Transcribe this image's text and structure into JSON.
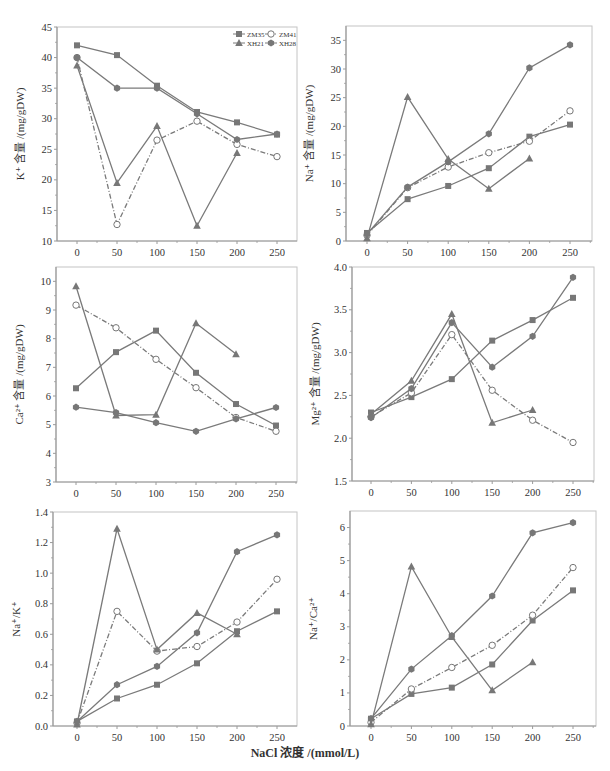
{
  "figure": {
    "shared_xlabel": "NaCl 浓度 /(mmol/L)",
    "legend": [
      {
        "name": "ZM35",
        "marker": "square",
        "dash": "solid"
      },
      {
        "name": "ZM41",
        "marker": "open-circle",
        "dash": "dashdot"
      },
      {
        "name": "XH21",
        "marker": "triangle",
        "dash": "solid"
      },
      {
        "name": "XH28",
        "marker": "hexagon",
        "dash": "solid"
      }
    ],
    "colors": {
      "line": "#7a7a7a",
      "marker": "#777777",
      "axis": "#9a9a9a",
      "text": "#333333"
    }
  },
  "chart_data": [
    {
      "type": "line",
      "title": "",
      "ylabel": "K⁺ 含量 /(mg/gDW)",
      "xlabel": "",
      "x": [
        0,
        50,
        100,
        150,
        200,
        250
      ],
      "xticks": [
        0,
        50,
        100,
        150,
        200,
        250
      ],
      "ylim": [
        10,
        45
      ],
      "yticks": [
        10,
        15,
        20,
        25,
        30,
        35,
        40,
        45
      ],
      "ytick_labels": [
        "10",
        "15",
        "20",
        "25",
        "30",
        "35",
        "40",
        "45"
      ],
      "legend_position": "upper right",
      "grid": false,
      "series": [
        {
          "name": "ZM35",
          "values": [
            42.0,
            40.4,
            35.4,
            31.1,
            29.4,
            27.4
          ]
        },
        {
          "name": "ZM41",
          "values": [
            40.0,
            12.7,
            26.5,
            29.6,
            25.8,
            23.8
          ]
        },
        {
          "name": "XH21",
          "values": [
            38.7,
            19.5,
            28.8,
            12.5,
            24.4,
            null
          ]
        },
        {
          "name": "XH28",
          "values": [
            40.0,
            35.0,
            35.0,
            30.8,
            26.6,
            27.5
          ]
        }
      ]
    },
    {
      "type": "line",
      "title": "",
      "ylabel": "Na⁺ 含量 /(mg/gDW)",
      "xlabel": "",
      "x": [
        0,
        50,
        100,
        150,
        200,
        250
      ],
      "xticks": [
        0,
        50,
        100,
        150,
        200,
        250
      ],
      "ylim": [
        0,
        37.5
      ],
      "yticks": [
        0,
        5,
        10,
        15,
        20,
        25,
        30,
        35
      ],
      "ytick_labels": [
        "0",
        "5",
        "10",
        "15",
        "20",
        "25",
        "30",
        "35"
      ],
      "grid": false,
      "series": [
        {
          "name": "ZM35",
          "values": [
            1.4,
            7.3,
            9.6,
            12.7,
            18.2,
            20.3
          ]
        },
        {
          "name": "ZM41",
          "values": [
            1.0,
            9.3,
            12.9,
            15.4,
            17.4,
            22.7
          ]
        },
        {
          "name": "XH21",
          "values": [
            0.5,
            25.1,
            14.3,
            9.1,
            14.4,
            null
          ]
        },
        {
          "name": "XH28",
          "values": [
            1.2,
            9.4,
            13.8,
            18.7,
            30.2,
            34.2
          ]
        }
      ]
    },
    {
      "type": "line",
      "title": "",
      "ylabel": "Ca²⁺ 含量 /(mg/gDW)",
      "xlabel": "",
      "x": [
        0,
        50,
        100,
        150,
        200,
        250
      ],
      "xticks": [
        0,
        50,
        100,
        150,
        200,
        250
      ],
      "ylim": [
        3,
        10.5
      ],
      "yticks": [
        3,
        4,
        5,
        6,
        7,
        8,
        9,
        10
      ],
      "ytick_labels": [
        "3",
        "4",
        "5",
        "6",
        "7",
        "8",
        "9",
        "10"
      ],
      "grid": false,
      "series": [
        {
          "name": "ZM35",
          "values": [
            6.27,
            7.53,
            8.28,
            6.81,
            5.72,
            4.97
          ]
        },
        {
          "name": "ZM41",
          "values": [
            9.17,
            8.38,
            7.28,
            6.29,
            5.25,
            4.77
          ]
        },
        {
          "name": "XH21",
          "values": [
            9.83,
            5.32,
            5.35,
            8.54,
            7.46,
            null
          ]
        },
        {
          "name": "XH28",
          "values": [
            5.61,
            5.42,
            5.07,
            4.77,
            5.2,
            5.6
          ]
        }
      ]
    },
    {
      "type": "line",
      "title": "",
      "ylabel": "Mg²⁺ 含量 /(mg/gDW)",
      "xlabel": "",
      "x": [
        0,
        50,
        100,
        150,
        200,
        250
      ],
      "xticks": [
        0,
        50,
        100,
        150,
        200,
        250
      ],
      "ylim": [
        1.5,
        4.0
      ],
      "yticks": [
        1.5,
        2.0,
        2.5,
        3.0,
        3.5,
        4.0
      ],
      "ytick_labels": [
        "1.5",
        "2.0",
        "2.5",
        "3.0",
        "3.5",
        "4.0"
      ],
      "grid": false,
      "series": [
        {
          "name": "ZM35",
          "values": [
            2.3,
            2.48,
            2.69,
            3.14,
            3.38,
            3.64
          ]
        },
        {
          "name": "ZM41",
          "values": [
            2.25,
            2.53,
            3.21,
            2.56,
            2.21,
            1.95
          ]
        },
        {
          "name": "XH21",
          "values": [
            2.28,
            2.67,
            3.45,
            2.18,
            2.33,
            null
          ]
        },
        {
          "name": "XH28",
          "values": [
            2.24,
            2.58,
            3.35,
            2.83,
            3.19,
            3.88
          ]
        }
      ]
    },
    {
      "type": "line",
      "title": "",
      "ylabel": "Na⁺/K⁺",
      "xlabel": "",
      "x": [
        0,
        50,
        100,
        150,
        200,
        250
      ],
      "xticks": [
        0,
        50,
        100,
        150,
        200,
        250
      ],
      "ylim": [
        0.0,
        1.4
      ],
      "yticks": [
        0.0,
        0.2,
        0.4,
        0.6,
        0.8,
        1.0,
        1.2,
        1.4
      ],
      "ytick_labels": [
        "0.0",
        "0.2",
        "0.4",
        "0.6",
        "0.8",
        "1.0",
        "1.2",
        "1.4"
      ],
      "grid": false,
      "series": [
        {
          "name": "ZM35",
          "values": [
            0.03,
            0.18,
            0.27,
            0.41,
            0.62,
            0.75
          ]
        },
        {
          "name": "ZM41",
          "values": [
            0.02,
            0.75,
            0.49,
            0.52,
            0.68,
            0.96
          ]
        },
        {
          "name": "XH21",
          "values": [
            0.01,
            1.29,
            0.5,
            0.74,
            0.6,
            null
          ]
        },
        {
          "name": "XH28",
          "values": [
            0.03,
            0.27,
            0.39,
            0.61,
            1.14,
            1.25
          ]
        }
      ]
    },
    {
      "type": "line",
      "title": "",
      "ylabel": "Na⁺/Ca²⁺",
      "xlabel": "",
      "x": [
        0,
        50,
        100,
        150,
        200,
        250
      ],
      "xticks": [
        0,
        50,
        100,
        150,
        200,
        250
      ],
      "ylim": [
        0,
        6.5
      ],
      "yticks": [
        0,
        1,
        2,
        3,
        4,
        5,
        6
      ],
      "ytick_labels": [
        "0",
        "1",
        "2",
        "3",
        "4",
        "5",
        "6"
      ],
      "grid": false,
      "series": [
        {
          "name": "ZM35",
          "values": [
            0.22,
            0.97,
            1.16,
            1.86,
            3.19,
            4.1
          ]
        },
        {
          "name": "ZM41",
          "values": [
            0.11,
            1.12,
            1.77,
            2.44,
            3.35,
            4.79
          ]
        },
        {
          "name": "XH21",
          "values": [
            0.05,
            4.82,
            2.69,
            1.08,
            1.93,
            null
          ]
        },
        {
          "name": "XH28",
          "values": [
            0.22,
            1.72,
            2.73,
            3.93,
            5.84,
            6.15
          ]
        }
      ]
    }
  ],
  "layout": {
    "panels": [
      {
        "left": 57,
        "top": 27,
        "right": 297,
        "bottom": 241,
        "x0": 77,
        "x250": 277,
        "show_legend": true
      },
      {
        "left": 346,
        "top": 26,
        "right": 592,
        "bottom": 241,
        "x0": 367,
        "x250": 570,
        "show_legend": false
      },
      {
        "left": 56,
        "top": 267,
        "right": 297,
        "bottom": 482,
        "x0": 76,
        "x250": 276,
        "show_legend": false
      },
      {
        "left": 352,
        "top": 267,
        "right": 594,
        "bottom": 481,
        "x0": 371,
        "x250": 573,
        "show_legend": false
      },
      {
        "left": 53,
        "top": 512,
        "right": 297,
        "bottom": 726,
        "x0": 77,
        "x250": 277,
        "show_legend": false
      },
      {
        "left": 350,
        "top": 511,
        "right": 596,
        "bottom": 726,
        "x0": 371,
        "x250": 573,
        "show_legend": false
      }
    ]
  }
}
